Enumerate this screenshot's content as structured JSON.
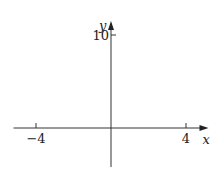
{
  "chart_data": {
    "type": "line",
    "title": "",
    "xlabel": "x",
    "ylabel": "y",
    "xlim": [
      -5.2,
      5.2
    ],
    "ylim": [
      -4.2,
      11.5
    ],
    "x_ticks": [
      {
        "value": -4,
        "label": "−4"
      },
      {
        "value": 4,
        "label": "4"
      }
    ],
    "y_ticks": [
      {
        "value": 10,
        "label": "10"
      }
    ],
    "series": [],
    "grid": false
  }
}
